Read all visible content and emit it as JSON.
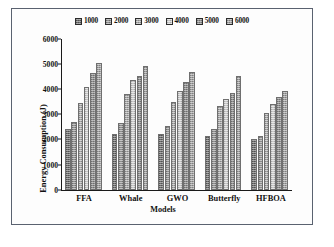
{
  "chart_data": {
    "type": "bar",
    "title": "",
    "xlabel": "Models",
    "ylabel": "Energy Consumption (J)",
    "categories": [
      "FFA",
      "Whale",
      "GWO",
      "Butterfly",
      "HFBOA"
    ],
    "ylim": [
      0,
      6000
    ],
    "yticks": [
      0,
      1000,
      2000,
      3000,
      4000,
      5000,
      6000
    ],
    "grid": false,
    "legend_position": "top-center",
    "series": [
      {
        "name": "1000",
        "color": "#6e6e6e",
        "values": [
          2400,
          2220,
          2220,
          2130,
          2010
        ]
      },
      {
        "name": "2000",
        "color": "#8c8c8c",
        "values": [
          2700,
          2650,
          2520,
          2420,
          2150
        ]
      },
      {
        "name": "3000",
        "color": "#a5a5a5",
        "values": [
          3450,
          3820,
          3480,
          3320,
          3050
        ]
      },
      {
        "name": "4000",
        "color": "#c4c4c4",
        "values": [
          4100,
          4350,
          3950,
          3620,
          3400
        ]
      },
      {
        "name": "5000",
        "color": "#8f8f8f",
        "values": [
          4650,
          4520,
          4270,
          3840,
          3700
        ]
      },
      {
        "name": "6000",
        "color": "#a0a0a0",
        "values": [
          5050,
          4930,
          4680,
          4520,
          3930
        ]
      }
    ]
  }
}
